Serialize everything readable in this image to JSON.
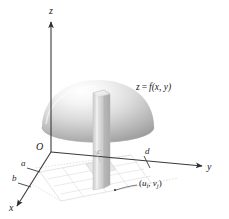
{
  "figure": {
    "name": "double-integral-riemann-sum-diagram",
    "background_color": "#ffffff",
    "axes": {
      "z_label": "z",
      "y_label": "y",
      "x_label": "x",
      "origin_label": "O"
    },
    "ticks": {
      "x_lower": "a",
      "x_upper": "b",
      "y_lower": "c",
      "y_upper": "d"
    },
    "surface_label": {
      "prefix": "z",
      "equals": "=",
      "func": "f",
      "args": "(x, y)",
      "full": "z = f(x, y)"
    },
    "sample_point": {
      "open_paren": "(",
      "u": "u",
      "u_sub": "i",
      "comma": ", ",
      "v": "v",
      "v_sub": "j",
      "close_paren": ")",
      "full": "(u , v )"
    },
    "colors": {
      "axis": "#3a3a3a",
      "surface_light": "#fdfdfd",
      "surface_mid": "#c9c9c9",
      "surface_dark": "#8e8e8e",
      "column_light": "#f2f2f2",
      "column_mid": "#d4d4d4",
      "column_dark": "#b2b2b2",
      "grid": "#cfcfcf",
      "grid_faint": "#dddddd"
    }
  }
}
